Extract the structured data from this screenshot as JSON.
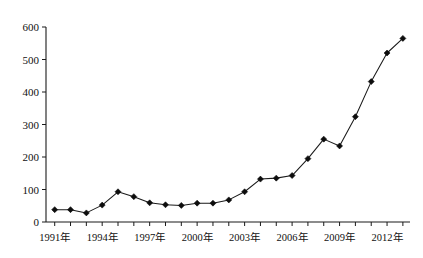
{
  "chart_data": {
    "type": "line",
    "title": "",
    "subtitle": "",
    "xlabel": "",
    "ylabel": "",
    "xlim": [
      1990.5,
      2013.5
    ],
    "ylim": [
      0,
      600
    ],
    "grid": false,
    "legend": null,
    "marker": "diamond",
    "line_color": "#1a1a1a",
    "marker_color": "#0d0d0d",
    "background": "#ffffff",
    "y_ticks": [
      0,
      100,
      200,
      300,
      400,
      500,
      600
    ],
    "y_tick_labels": [
      "0",
      "100",
      "200",
      "300",
      "400",
      "500",
      "600"
    ],
    "x_tick_values": [
      1991,
      1992,
      1993,
      1994,
      1995,
      1996,
      1997,
      1998,
      1999,
      2000,
      2001,
      2002,
      2003,
      2004,
      2005,
      2006,
      2007,
      2008,
      2009,
      2010,
      2011,
      2012,
      2013
    ],
    "x_tick_labels": [
      "1991年",
      "",
      "",
      "1994年",
      "",
      "",
      "1997年",
      "",
      "",
      "2000年",
      "",
      "",
      "2003年",
      "",
      "",
      "2006年",
      "",
      "",
      "2009年",
      "",
      "",
      "2012年",
      ""
    ],
    "x_labeled_years": [
      "1991年",
      "1994年",
      "1997年",
      "2000年",
      "2003年",
      "2006年",
      "2009年",
      "2012年"
    ],
    "x": [
      1991,
      1992,
      1993,
      1994,
      1995,
      1996,
      1997,
      1998,
      1999,
      2000,
      2001,
      2002,
      2003,
      2004,
      2005,
      2006,
      2007,
      2008,
      2009,
      2010,
      2011,
      2012,
      2013
    ],
    "values": [
      38,
      38,
      28,
      52,
      93,
      78,
      59,
      53,
      51,
      58,
      58,
      68,
      93,
      132,
      135,
      143,
      195,
      255,
      234,
      324,
      432,
      520,
      565
    ],
    "series": [
      {
        "name": "",
        "values": [
          38,
          38,
          28,
          52,
          93,
          78,
          59,
          53,
          51,
          58,
          58,
          68,
          93,
          132,
          135,
          143,
          195,
          255,
          234,
          324,
          432,
          520,
          565
        ]
      }
    ]
  },
  "axes": {
    "y_axis_name": "value-axis",
    "x_axis_name": "year-axis"
  }
}
